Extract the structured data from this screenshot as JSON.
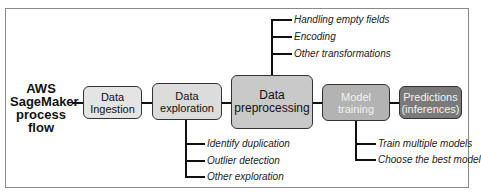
{
  "diagram": {
    "title": "AWS SageMaker process flow",
    "title_lines": [
      "AWS",
      "SageMaker",
      "process",
      "flow"
    ],
    "steps": [
      {
        "id": "ingestion",
        "lines": [
          "Data",
          "Ingestion"
        ],
        "fill": "#e4e4e4"
      },
      {
        "id": "exploration",
        "lines": [
          "Data",
          "exploration"
        ],
        "fill": "#dcdcdc"
      },
      {
        "id": "preprocessing",
        "lines": [
          "Data",
          "preprocessing"
        ],
        "fill": "#c9c9c9"
      },
      {
        "id": "training",
        "lines": [
          "Model",
          "training"
        ],
        "fill": "#b3b3b3"
      },
      {
        "id": "predictions",
        "lines": [
          "Predictions",
          "(inferences)"
        ],
        "fill": "#7a7a7a"
      }
    ],
    "branches": {
      "preprocessing": [
        "Handling empty fields",
        "Encoding",
        "Other transformations"
      ],
      "exploration": [
        "Identify duplication",
        "Outlier detection",
        "Other exploration"
      ],
      "training": [
        "Train multiple models",
        "Choose the best model"
      ]
    }
  }
}
